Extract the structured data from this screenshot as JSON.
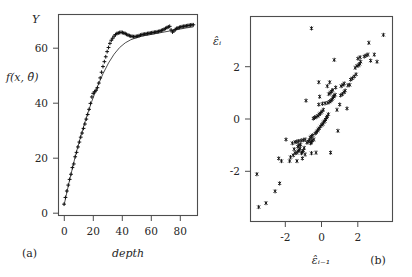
{
  "figure": {
    "background": "#ffffff",
    "ink_color": "#262626",
    "frame_color": "#4d4d4d"
  },
  "panel_a": {
    "tag": "(a)",
    "y_axis_name": "Y",
    "y_axis_title": "f(x, θ̂)",
    "x_axis_title": "depth",
    "x_ticks": [
      "0",
      "20",
      "40",
      "60",
      "80"
    ],
    "y_ticks": [
      "0",
      "20",
      "40",
      "60"
    ]
  },
  "panel_b": {
    "tag": "(b)",
    "y_axis_title": "ε̂ᵢ",
    "x_axis_title": "ε̂ᵢ₋₁",
    "x_ticks": [
      "-2",
      "0",
      "2"
    ],
    "y_ticks": [
      "-2",
      "0",
      "2"
    ]
  },
  "chart_data": [
    {
      "type": "scatter",
      "id": "panel-a",
      "title": "",
      "xlabel": "depth",
      "ylabel": "f(x, theta-hat)",
      "y_axis_corner_label": "Y",
      "panel_label": "(a)",
      "xlim": [
        -4,
        96
      ],
      "ylim": [
        -4,
        74
      ],
      "xticks": [
        0,
        20,
        40,
        60,
        80
      ],
      "yticks": [
        0,
        20,
        40,
        60
      ],
      "grid": false,
      "legend": "none",
      "marker": "plus",
      "series": [
        {
          "name": "observed Y",
          "x": [
            0,
            1,
            2,
            3,
            4,
            5,
            6,
            7,
            8,
            9,
            10,
            11,
            12,
            13,
            14,
            15,
            16,
            17,
            18,
            19,
            20,
            21,
            22,
            23,
            24,
            25,
            26,
            27,
            28,
            29,
            30,
            31,
            32,
            33,
            34,
            35,
            36,
            37,
            38,
            39,
            40,
            41,
            42,
            43,
            44,
            45,
            46,
            47,
            48,
            49,
            50,
            51,
            52,
            53,
            54,
            55,
            56,
            57,
            58,
            59,
            60,
            61,
            62,
            63,
            64,
            65,
            66,
            67,
            68,
            69,
            70,
            71,
            72,
            73,
            74,
            75,
            76,
            77,
            78,
            79,
            80,
            81,
            82,
            83,
            84,
            85,
            86,
            87,
            88,
            89,
            90,
            91,
            92,
            93
          ],
          "y": [
            0.4,
            3.0,
            5.5,
            7.8,
            10.0,
            12.0,
            14.6,
            16.0,
            18.8,
            20.5,
            22.6,
            24.5,
            26.4,
            28.0,
            29.8,
            31.5,
            33.4,
            35.2,
            37.2,
            39.5,
            42.0,
            43.4,
            44.0,
            44.6,
            45.6,
            47.4,
            49.4,
            51.6,
            53.8,
            55.7,
            57.6,
            59.6,
            61.2,
            62.8,
            64.0,
            64.8,
            65.6,
            66.2,
            66.6,
            66.8,
            67.0,
            67.1,
            67.0,
            66.8,
            66.6,
            66.3,
            66.0,
            65.8,
            65.6,
            65.5,
            65.4,
            65.4,
            65.5,
            65.6,
            65.8,
            66.0,
            66.2,
            66.3,
            66.4,
            66.5,
            66.6,
            66.7,
            66.8,
            66.9,
            67.0,
            67.1,
            67.2,
            67.3,
            67.4,
            67.6,
            67.8,
            68.0,
            68.3,
            68.6,
            68.9,
            69.2,
            69.4,
            68.0,
            67.2,
            67.6,
            68.2,
            68.6,
            68.8,
            69.0,
            69.2,
            69.3,
            69.4,
            69.5,
            69.6,
            69.7,
            69.8,
            69.9,
            70.0,
            70.0
          ]
        },
        {
          "name": "fitted f(x, theta-hat)",
          "type": "line",
          "x": [
            0,
            4,
            8,
            12,
            16,
            20,
            24,
            28,
            32,
            36,
            40,
            44,
            48,
            52,
            56,
            60,
            64,
            68,
            72,
            76,
            80,
            84,
            88,
            93
          ],
          "y": [
            0.0,
            9.8,
            18.8,
            26.8,
            34.0,
            40.4,
            46.0,
            51.0,
            55.2,
            58.6,
            61.2,
            63.0,
            64.2,
            65.0,
            65.6,
            66.0,
            66.4,
            66.8,
            67.2,
            67.6,
            68.0,
            68.4,
            68.8,
            69.2
          ]
        }
      ]
    },
    {
      "type": "scatter",
      "id": "panel-b",
      "title": "",
      "xlabel": "epsilon-hat_{i-1}",
      "ylabel": "epsilon-hat_i",
      "panel_label": "(b)",
      "xlim": [
        -3.9,
        3.9
      ],
      "ylim": [
        -3.9,
        3.9
      ],
      "xticks": [
        -2,
        0,
        2
      ],
      "yticks": [
        -2,
        0,
        2
      ],
      "grid": false,
      "legend": "none",
      "marker": "asterisk",
      "points": [
        [
          -3.45,
          -3.35
        ],
        [
          -3.05,
          -3.2
        ],
        [
          -2.55,
          -2.75
        ],
        [
          -2.3,
          -2.45
        ],
        [
          -3.55,
          -2.1
        ],
        [
          -2.2,
          -1.6
        ],
        [
          -1.75,
          -1.6
        ],
        [
          -1.35,
          -1.6
        ],
        [
          -1.7,
          -1.45
        ],
        [
          -1.55,
          -1.38
        ],
        [
          -1.45,
          -1.3
        ],
        [
          -1.35,
          -1.28
        ],
        [
          -1.28,
          -1.22
        ],
        [
          -1.22,
          -1.18
        ],
        [
          -1.18,
          -1.12
        ],
        [
          -1.1,
          -1.3
        ],
        [
          -1.05,
          -1.25
        ],
        [
          -1.0,
          -1.2
        ],
        [
          -0.95,
          -1.1
        ],
        [
          -1.3,
          -1.05
        ],
        [
          -1.25,
          -1.0
        ],
        [
          -1.15,
          -0.98
        ],
        [
          -1.6,
          -0.92
        ],
        [
          -1.45,
          -0.88
        ],
        [
          -1.35,
          -0.86
        ],
        [
          -1.25,
          -0.84
        ],
        [
          -1.12,
          -0.82
        ],
        [
          -1.0,
          -0.8
        ],
        [
          -0.9,
          -0.78
        ],
        [
          -0.8,
          -0.9
        ],
        [
          -0.72,
          -0.85
        ],
        [
          -0.65,
          -0.8
        ],
        [
          -0.6,
          -0.92
        ],
        [
          -0.55,
          -0.88
        ],
        [
          -0.5,
          -0.82
        ],
        [
          -0.42,
          -0.78
        ],
        [
          -0.62,
          -0.7
        ],
        [
          -0.55,
          -0.66
        ],
        [
          -0.48,
          -0.62
        ],
        [
          -1.95,
          -0.78
        ],
        [
          -1.5,
          -1.15
        ],
        [
          -0.9,
          -1.35
        ],
        [
          -0.55,
          -1.3
        ],
        [
          -0.3,
          -1.28
        ],
        [
          0.5,
          -1.28
        ],
        [
          0.9,
          -0.45
        ],
        [
          -0.35,
          -0.55
        ],
        [
          -0.28,
          -0.5
        ],
        [
          -0.22,
          -0.45
        ],
        [
          -0.18,
          -0.4
        ],
        [
          -0.12,
          -0.35
        ],
        [
          -0.05,
          -0.28
        ],
        [
          0.02,
          -0.22
        ],
        [
          0.08,
          -0.18
        ],
        [
          0.12,
          -0.12
        ],
        [
          0.18,
          -0.08
        ],
        [
          0.22,
          -0.02
        ],
        [
          0.28,
          0.05
        ],
        [
          0.32,
          0.1
        ],
        [
          0.38,
          0.18
        ],
        [
          -0.45,
          0.02
        ],
        [
          -0.38,
          0.05
        ],
        [
          -0.3,
          0.08
        ],
        [
          -0.2,
          0.12
        ],
        [
          -0.12,
          0.18
        ],
        [
          -0.05,
          0.22
        ],
        [
          0.02,
          0.28
        ],
        [
          0.1,
          0.35
        ],
        [
          -0.85,
          0.7
        ],
        [
          -0.15,
          0.55
        ],
        [
          0.05,
          0.58
        ],
        [
          0.2,
          0.6
        ],
        [
          0.35,
          0.62
        ],
        [
          0.45,
          0.66
        ],
        [
          0.52,
          0.7
        ],
        [
          0.58,
          0.74
        ],
        [
          0.62,
          0.8
        ],
        [
          0.66,
          0.85
        ],
        [
          0.7,
          0.88
        ],
        [
          0.75,
          0.92
        ],
        [
          0.4,
          0.95
        ],
        [
          0.48,
          1.0
        ],
        [
          0.55,
          1.05
        ],
        [
          0.62,
          1.1
        ],
        [
          1.05,
          0.9
        ],
        [
          1.15,
          0.95
        ],
        [
          1.25,
          1.02
        ],
        [
          1.3,
          1.08
        ],
        [
          1.08,
          1.25
        ],
        [
          1.18,
          1.3
        ],
        [
          1.25,
          1.35
        ],
        [
          0.32,
          1.25
        ],
        [
          0.45,
          1.4
        ],
        [
          -0.15,
          1.4
        ],
        [
          0.7,
          2.25
        ],
        [
          1.6,
          1.5
        ],
        [
          1.7,
          1.55
        ],
        [
          1.8,
          1.62
        ],
        [
          1.9,
          1.7
        ],
        [
          1.85,
          1.95
        ],
        [
          1.95,
          2.02
        ],
        [
          2.05,
          2.05
        ],
        [
          2.1,
          2.1
        ],
        [
          2.15,
          2.18
        ],
        [
          2.0,
          2.3
        ],
        [
          2.12,
          2.35
        ],
        [
          1.55,
          1.3
        ],
        [
          1.45,
          1.28
        ],
        [
          2.35,
          2.38
        ],
        [
          2.45,
          2.42
        ],
        [
          2.55,
          2.45
        ],
        [
          2.7,
          2.22
        ],
        [
          2.9,
          2.45
        ],
        [
          2.6,
          2.9
        ],
        [
          3.4,
          3.2
        ],
        [
          -0.55,
          3.45
        ],
        [
          3.05,
          2.18
        ],
        [
          1.4,
          0.4
        ],
        [
          -2.35,
          -1.5
        ],
        [
          -1.05,
          -1.5
        ],
        [
          -0.1,
          0.85
        ],
        [
          0.85,
          0.35
        ],
        [
          1.0,
          0.55
        ],
        [
          0.78,
          1.2
        ]
      ]
    }
  ]
}
